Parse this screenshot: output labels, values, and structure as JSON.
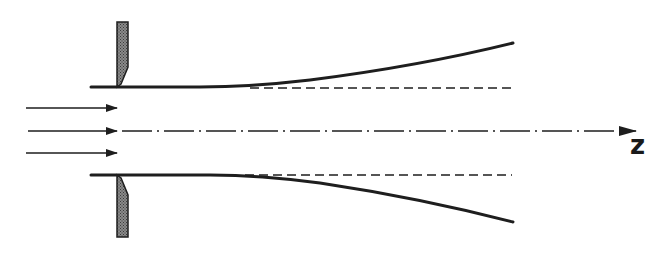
{
  "diagram": {
    "title": "",
    "axis_label": "z",
    "colors": {
      "line": "#1e1e1e",
      "electrode_fill": "#6a6a6a",
      "background": "#ffffff"
    },
    "elements": {
      "inflow_arrows": {
        "count": 3,
        "direction": "right"
      },
      "electrodes": {
        "count": 2,
        "style": "hatched-stipple"
      },
      "tube_walls": {
        "count": 2,
        "style": "solid-curving-outward"
      },
      "reference_lines": {
        "count": 2,
        "style": "dashed-straight"
      },
      "center_axis": {
        "style": "dash-dot",
        "arrow": "right"
      }
    }
  }
}
